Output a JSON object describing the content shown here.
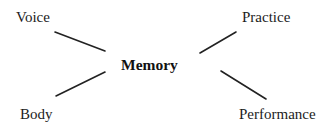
{
  "diagram": {
    "type": "radial-concept-map",
    "center": {
      "label": "Memory",
      "bold": true
    },
    "nodes": [
      {
        "id": "voice",
        "label": "Voice",
        "position": "top-left"
      },
      {
        "id": "practice",
        "label": "Practice",
        "position": "top-right"
      },
      {
        "id": "body",
        "label": "Body",
        "position": "bottom-left"
      },
      {
        "id": "performance",
        "label": "Performance",
        "position": "bottom-right"
      }
    ],
    "edges": [
      {
        "from": "voice",
        "to": "center",
        "x1": 55,
        "y1": 32,
        "x2": 105,
        "y2": 51
      },
      {
        "from": "body",
        "to": "center",
        "x1": 56,
        "y1": 96,
        "x2": 105,
        "y2": 72
      },
      {
        "from": "practice",
        "to": "center",
        "x1": 236,
        "y1": 32,
        "x2": 200,
        "y2": 53
      },
      {
        "from": "performance",
        "to": "center",
        "x1": 266,
        "y1": 99,
        "x2": 221,
        "y2": 71
      }
    ],
    "colors": {
      "background": "#ffffff",
      "text": "#1c1c1c",
      "line": "#222222"
    }
  }
}
